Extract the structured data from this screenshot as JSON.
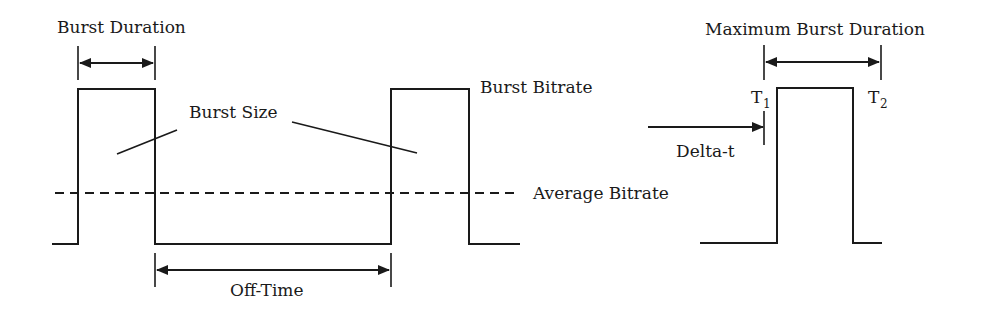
{
  "diagram": {
    "left": {
      "labels": {
        "burst_duration": "Burst Duration",
        "burst_size": "Burst Size",
        "burst_bitrate": "Burst Bitrate",
        "average_bitrate": "Average Bitrate",
        "off_time": "Off-Time"
      }
    },
    "right": {
      "labels": {
        "maximum_burst_duration": "Maximum Burst Duration",
        "t1": "T",
        "t1_sub": "1",
        "t2": "T",
        "t2_sub": "2",
        "delta_t": "Delta-t"
      }
    },
    "colors": {
      "line": "#1a1a1a",
      "background": "#ffffff"
    }
  }
}
